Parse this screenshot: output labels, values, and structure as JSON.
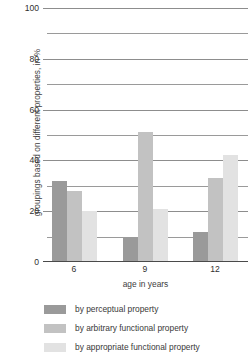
{
  "chart_data": {
    "type": "bar",
    "title": "",
    "xlabel": "age in years",
    "ylabel": "groupings based on different properties, in %",
    "categories": [
      "6",
      "9",
      "12"
    ],
    "series": [
      {
        "name": "by perceptual property",
        "values": [
          32,
          10,
          12
        ],
        "color": "#9a9a9a"
      },
      {
        "name": "by arbitrary functional property",
        "values": [
          28,
          51,
          33
        ],
        "color": "#c2c2c2"
      },
      {
        "name": "by appropriate functional property",
        "values": [
          20,
          21,
          42
        ],
        "color": "#e2e2e2"
      }
    ],
    "ylim": [
      0,
      100
    ],
    "y_ticks_major": [
      0,
      20,
      40,
      60,
      80,
      100
    ],
    "y_ticks_minor": [
      10,
      30,
      50,
      70,
      90
    ],
    "y_tick_labels": [
      "0",
      "20",
      "40",
      "60",
      "80",
      "100"
    ],
    "grid": true,
    "legend_position": "bottom-left"
  },
  "axis": {
    "y_title": "groupings based on different properties, in %",
    "x_title": "age in years"
  },
  "legend": {
    "items": [
      {
        "label": "by perceptual property",
        "color": "#9a9a9a"
      },
      {
        "label": "by arbitrary functional property",
        "color": "#c2c2c2"
      },
      {
        "label": "by appropriate functional property",
        "color": "#e2e2e2"
      }
    ]
  }
}
